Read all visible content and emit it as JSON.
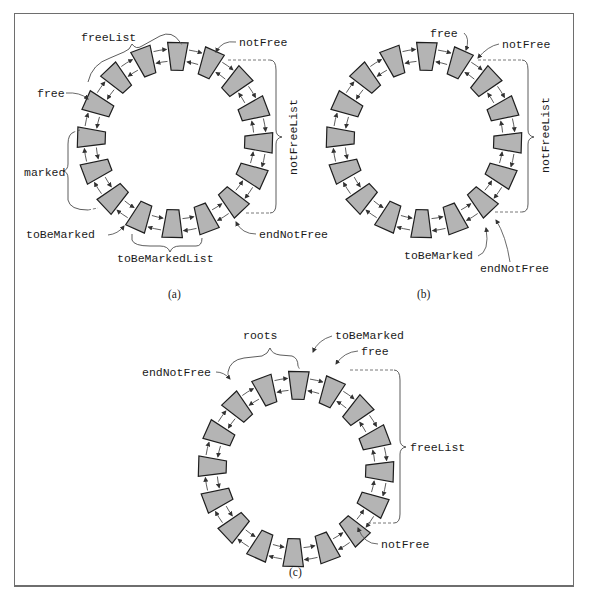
{
  "figure": {
    "border_color": "#6e6e6e",
    "block_fill": "#b4b4b4",
    "block_stroke": "#1e1e1e",
    "blocks_per_ring": 16
  },
  "panels": [
    {
      "id": "a",
      "caption": "(a)",
      "center": [
        175,
        140
      ],
      "radius": 87,
      "labels": {
        "freeList": "freeList",
        "notFree": "notFree",
        "free": "free",
        "notFreeList": "notFreeList",
        "marked": "marked",
        "toBeMarked": "toBeMarked",
        "endNotFree": "endNotFree",
        "toBeMarkedList": "toBeMarkedList"
      }
    },
    {
      "id": "b",
      "caption": "(b)",
      "center": [
        424,
        140
      ],
      "radius": 87,
      "labels": {
        "free": "free",
        "notFree": "notFree",
        "notFreeList": "notFreeList",
        "toBeMarked": "toBeMarked",
        "endNotFree": "endNotFree"
      }
    },
    {
      "id": "c",
      "caption": "(c)",
      "center": [
        296,
        469
      ],
      "radius": 87,
      "labels": {
        "roots": "roots",
        "toBeMarked": "toBeMarked",
        "endNotFree": "endNotFree",
        "free": "free",
        "freeList": "freeList",
        "notFree": "notFree"
      }
    }
  ]
}
